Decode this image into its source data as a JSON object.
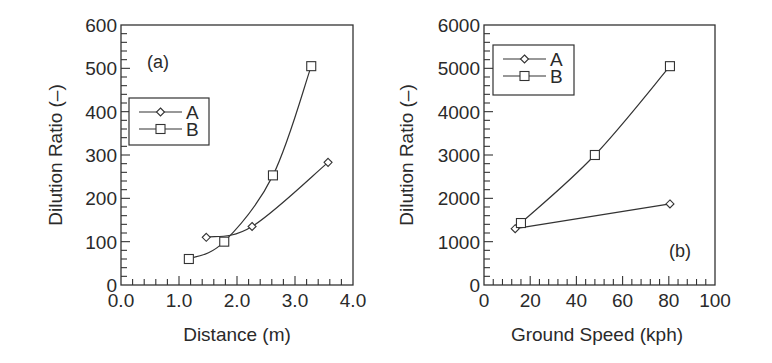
{
  "chart_data": [
    {
      "type": "line",
      "panel_label": "(a)",
      "title": "",
      "xlabel": "Distance (m)",
      "ylabel": "Dilution Ratio (–)",
      "xlim": [
        0.0,
        4.0
      ],
      "ylim": [
        0,
        600
      ],
      "x_ticks": [
        "0.0",
        "1.0",
        "2.0",
        "3.0",
        "4.0"
      ],
      "x_tick_values": [
        0,
        1,
        2,
        3,
        4
      ],
      "x_minor_step": 0.2,
      "y_ticks": [
        "0",
        "100",
        "200",
        "300",
        "400",
        "500",
        "600"
      ],
      "y_tick_values": [
        0,
        100,
        200,
        300,
        400,
        500,
        600
      ],
      "y_minor_step": 20,
      "grid": false,
      "legend_position": "upper left (mid)",
      "series": [
        {
          "name": "A",
          "marker": "diamond",
          "x": [
            1.47,
            2.26,
            3.57
          ],
          "y": [
            110,
            135,
            283
          ]
        },
        {
          "name": "B",
          "marker": "square",
          "x": [
            1.17,
            1.78,
            2.62,
            3.28
          ],
          "y": [
            60,
            100,
            253,
            505
          ]
        }
      ]
    },
    {
      "type": "line",
      "panel_label": "(b)",
      "title": "",
      "xlabel": "Ground Speed (kph)",
      "ylabel": "Dilution Ratio (–)",
      "xlim": [
        0,
        100
      ],
      "ylim": [
        0,
        6000
      ],
      "x_ticks": [
        "0",
        "20",
        "40",
        "60",
        "80",
        "100"
      ],
      "x_tick_values": [
        0,
        20,
        40,
        60,
        80,
        100
      ],
      "x_minor_step": 4,
      "y_ticks": [
        "0",
        "1000",
        "2000",
        "3000",
        "4000",
        "5000",
        "6000"
      ],
      "y_tick_values": [
        0,
        1000,
        2000,
        3000,
        4000,
        5000,
        6000
      ],
      "y_minor_step": 200,
      "grid": false,
      "legend_position": "upper left",
      "series": [
        {
          "name": "A",
          "marker": "diamond",
          "x": [
            13.5,
            80.5
          ],
          "y": [
            1300,
            1870
          ]
        },
        {
          "name": "B",
          "marker": "square",
          "x": [
            16,
            48,
            80.5
          ],
          "y": [
            1430,
            3000,
            5050
          ]
        }
      ]
    }
  ],
  "panels": [
    {
      "plot_box": {
        "left": 121,
        "top": 25,
        "right": 353,
        "bottom": 285
      },
      "legend_box": {
        "left": 129,
        "top": 98,
        "width": 80,
        "height": 47
      },
      "panel_label_pos": {
        "x": 147,
        "y": 68
      },
      "curved": true
    },
    {
      "plot_box": {
        "left": 484,
        "top": 25,
        "right": 715,
        "bottom": 285
      },
      "legend_box": {
        "left": 493,
        "top": 45,
        "width": 81,
        "height": 50
      },
      "panel_label_pos": {
        "x": 669,
        "y": 257
      },
      "curved": false
    }
  ],
  "colors": {
    "ink": "#2a2a2a",
    "background": "#ffffff"
  }
}
